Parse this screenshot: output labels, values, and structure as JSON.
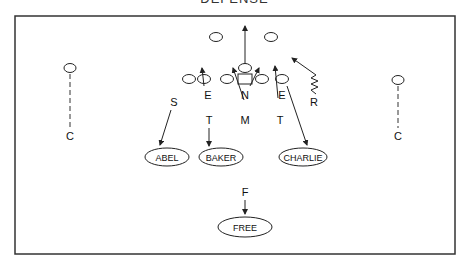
{
  "diagram": {
    "title": "DEFENSE",
    "players": {
      "left_corner": "C",
      "right_corner": "C",
      "strong_safety": "S",
      "left_end": "E",
      "right_end": "E",
      "nose": "N",
      "mike": "M",
      "left_tackle": "T",
      "right_tackle": "T",
      "rover": "R",
      "free_safety": "F"
    },
    "zones": {
      "abel": "ABEL",
      "baker": "BAKER",
      "charlie": "CHARLIE",
      "free": "FREE"
    }
  }
}
